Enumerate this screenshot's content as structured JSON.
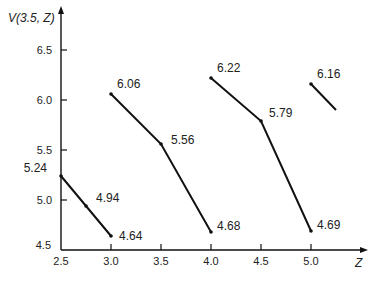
{
  "chart_data": {
    "type": "line",
    "title": "",
    "xlabel": "Z",
    "ylabel": "V(3.5, Z)",
    "xlim": [
      2.5,
      5.3
    ],
    "ylim": [
      4.5,
      6.8
    ],
    "x_ticks": [
      "2.5",
      "3.0",
      "3.5",
      "4.0",
      "4.5",
      "5.0"
    ],
    "y_ticks": [
      "4.5",
      "5.0",
      "5.5",
      "6.0",
      "6.5"
    ],
    "grid": false,
    "legend": null,
    "series": [
      {
        "name": "segment-1",
        "points": [
          {
            "x": 2.5,
            "y": 5.24,
            "label": "5.24"
          },
          {
            "x": 2.75,
            "y": 4.94,
            "label": "4.94"
          },
          {
            "x": 3.0,
            "y": 4.64,
            "label": "4.64"
          }
        ]
      },
      {
        "name": "segment-2",
        "points": [
          {
            "x": 3.0,
            "y": 6.06,
            "label": "6.06"
          },
          {
            "x": 3.5,
            "y": 5.56,
            "label": "5.56"
          },
          {
            "x": 4.0,
            "y": 4.68,
            "label": "4.68"
          }
        ]
      },
      {
        "name": "segment-3",
        "points": [
          {
            "x": 4.0,
            "y": 6.22,
            "label": "6.22"
          },
          {
            "x": 4.5,
            "y": 5.79,
            "label": "5.79"
          },
          {
            "x": 5.0,
            "y": 4.69,
            "label": "4.69"
          }
        ]
      },
      {
        "name": "segment-4",
        "points": [
          {
            "x": 5.0,
            "y": 6.16,
            "label": "6.16"
          },
          {
            "x": 5.25,
            "y": 5.9,
            "label": ""
          }
        ]
      }
    ]
  },
  "axes": {
    "y_title": "V(3.5, Z)",
    "x_title": "Z"
  }
}
